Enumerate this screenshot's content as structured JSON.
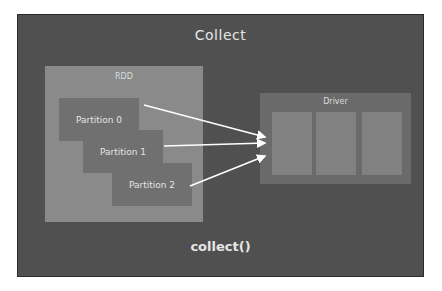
{
  "diagram": {
    "title": "Collect",
    "footer": "collect()",
    "rdd": {
      "label": "RDD",
      "partitions": [
        {
          "label": "Partition 0"
        },
        {
          "label": "Partition 1"
        },
        {
          "label": "Partition 2"
        }
      ]
    },
    "driver": {
      "label": "Driver",
      "slots": 3
    },
    "arrows": [
      {
        "from": "Partition 0",
        "to": "Driver"
      },
      {
        "from": "Partition 1",
        "to": "Driver"
      },
      {
        "from": "Partition 2",
        "to": "Driver"
      }
    ],
    "colors": {
      "background": "#505050",
      "rdd": "#8a8a8a",
      "partition": "#707070",
      "driver": "#6a6a6a",
      "driver_slot": "#818181",
      "text": "#e6e6e6",
      "arrow": "#ffffff"
    }
  }
}
